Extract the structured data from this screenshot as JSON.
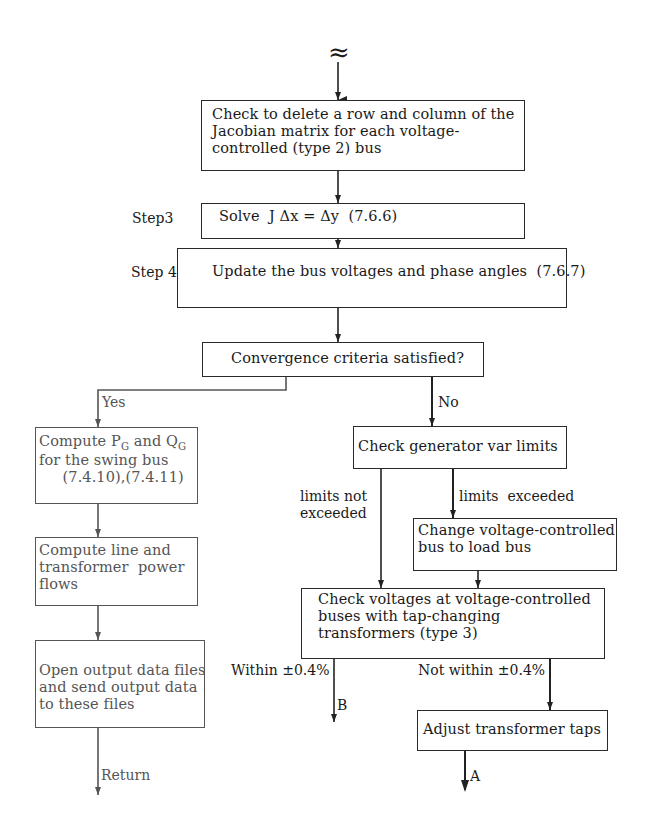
{
  "diagram": {
    "break_symbol": "≈",
    "boxes": {
      "delete_row": {
        "lines": [
          "Check to delete a row and column of the",
          "Jacobian matrix for each voltage-",
          "controlled (type 2) bus"
        ]
      },
      "solve": {
        "text": "Solve  J Δx = Δy  (7.6.6)"
      },
      "update": {
        "text": "Update the bus voltages and phase angles  (7.6.7)"
      },
      "convergence": {
        "text": "Convergence criteria satisfied?"
      },
      "compute_pg": {
        "line1_a": "Compute P",
        "line1_sub1": "G",
        "line1_b": " and Q",
        "line1_sub2": "G",
        "line2": "for the swing bus",
        "line3": "     (7.4.10),(7.4.11)"
      },
      "line_flows": {
        "lines": [
          "Compute line and",
          "transformer  power",
          "flows"
        ]
      },
      "output_files": {
        "lines": [
          "Open output data files",
          "and send output data",
          "to these files"
        ]
      },
      "gen_var": {
        "text": "Check generator var limits"
      },
      "change_bus": {
        "lines": [
          "Change voltage-controlled",
          "bus to load bus"
        ]
      },
      "check_voltages": {
        "lines": [
          "Check voltages at voltage-controlled",
          "buses with tap-changing",
          "transformers (type 3)"
        ]
      },
      "adjust_taps": {
        "text": "Adjust transformer taps"
      }
    },
    "step_labels": {
      "step3": "Step3",
      "step4": "Step 4"
    },
    "edge_labels": {
      "yes": "Yes",
      "no": "No",
      "limits_not_exceeded": [
        "limits not",
        "exceeded"
      ],
      "limits_exceeded": "limits  exceeded",
      "within": "Within ±0.4%",
      "not_within": "Not within ±0.4%",
      "return": "Return",
      "connector_b": "B",
      "connector_a": "A"
    }
  }
}
